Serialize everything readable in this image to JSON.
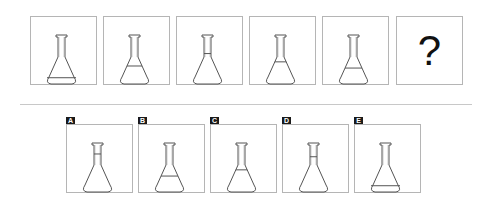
{
  "puzzle": {
    "sequence": [
      {
        "id": "1",
        "liquid_level": 0.88
      },
      {
        "id": "2",
        "liquid_level": 0.71
      },
      {
        "id": "3",
        "liquid_level": 0.53
      },
      {
        "id": "4",
        "liquid_level": 0.65
      },
      {
        "id": "5",
        "liquid_level": 0.74
      },
      {
        "id": "6",
        "question_mark": "?"
      }
    ],
    "options": [
      {
        "label": "A",
        "liquid_level": 0.42
      },
      {
        "label": "B",
        "liquid_level": 0.74
      },
      {
        "label": "C",
        "liquid_level": 0.65
      },
      {
        "label": "D",
        "liquid_level": 0.46
      },
      {
        "label": "E",
        "liquid_level": 0.88
      }
    ]
  },
  "colors": {
    "line": "#555555",
    "border": "#b5b5b5",
    "badge_bg": "#1a1a1a",
    "badge_text": "#ffffff"
  }
}
